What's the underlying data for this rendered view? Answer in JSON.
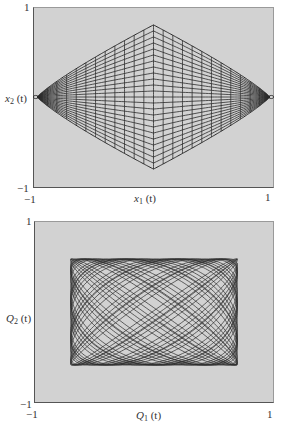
{
  "chart_data": [
    {
      "type": "line",
      "title": "",
      "xlabel": "x1 (t)",
      "ylabel": "x2 (t)",
      "xlabel_var": "x",
      "xlabel_sub": "1",
      "xlabel_arg": "(t)",
      "ylabel_var": "x",
      "ylabel_sub": "2",
      "ylabel_arg": "(t)",
      "xlim": [
        -1,
        1
      ],
      "ylim": [
        -1,
        1
      ],
      "x_ticks": [
        "-1",
        "1"
      ],
      "y_ticks": [
        "1",
        "-1"
      ],
      "grid": false,
      "legend": null,
      "background": "#d2d2d2",
      "line_color": "#2a2a2a",
      "description": "Phase trajectory x2(t) vs x1(t) of coupled oscillator (beating); lattice of curves filling a diamond-shaped envelope with vertices near (-0.97,0), (0.97,0), (0,0.81), (0,-0.81)",
      "envelope_vertices": [
        [
          -0.97,
          0.0
        ],
        [
          0.0,
          0.81
        ],
        [
          0.97,
          0.0
        ],
        [
          0.0,
          -0.81
        ]
      ],
      "curve": {
        "kind": "beating-lissajous",
        "w_fast": 21.0,
        "w_slow": 1.0,
        "samples": 5000
      }
    },
    {
      "type": "line",
      "title": "",
      "xlabel": "Q1 (t)",
      "ylabel": "Q2 (t)",
      "xlabel_var": "Q",
      "xlabel_sub": "1",
      "xlabel_arg": "(t)",
      "ylabel_var": "Q",
      "ylabel_sub": "2",
      "ylabel_arg": "(t)",
      "xlim": [
        -1,
        1
      ],
      "ylim": [
        -1,
        1
      ],
      "x_ticks": [
        "-1",
        "1"
      ],
      "y_ticks": [
        "1",
        "-1"
      ],
      "grid": false,
      "legend": null,
      "background": "#d2d2d2",
      "line_color": "#2a2a2a",
      "description": "Normal-coordinate trajectory Q2(t) vs Q1(t): Lissajous figure filling a rectangle approx Q1 in [-0.7, 0.7], Q2 in [-0.59, 0.59]",
      "rect_bounds": {
        "q1": [
          -0.7,
          0.7
        ],
        "q2": [
          -0.59,
          0.59
        ]
      },
      "curve": {
        "kind": "lissajous",
        "a": 0.7,
        "b": 0.59,
        "w1": 1.0,
        "w2": 1.113,
        "phase": 0.4,
        "t_max": 190,
        "samples": 6000
      }
    }
  ],
  "panels": {
    "top": {
      "y_tick_top": "1",
      "y_tick_bottom": "−1",
      "x_tick_left": "−1",
      "x_tick_right": "1",
      "xlabel": {
        "var": "x",
        "sub": "1",
        "arg": "(t)"
      },
      "ylabel": {
        "var": "x",
        "sub": "2",
        "arg": "(t)"
      }
    },
    "bottom": {
      "y_tick_top": "1",
      "y_tick_bottom": "−1",
      "x_tick_left": "−1",
      "x_tick_right": "1",
      "xlabel": {
        "var": "Q",
        "sub": "1",
        "arg": "(t)"
      },
      "ylabel": {
        "var": "Q",
        "sub": "2",
        "arg": "(t)"
      }
    }
  }
}
